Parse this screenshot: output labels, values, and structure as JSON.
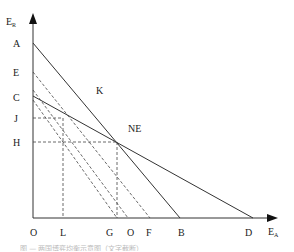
{
  "diagram": {
    "type": "economic-equilibrium-diagram",
    "axes": {
      "y_label": "E",
      "y_label_sub": "R",
      "x_label": "E",
      "x_label_sub": "A",
      "origin_label": "O"
    },
    "y_ticks": [
      "A",
      "E",
      "C",
      "J",
      "H"
    ],
    "x_ticks": [
      "O",
      "L",
      "G",
      "O",
      "F",
      "B",
      "D"
    ],
    "solid_lines": [
      {
        "name": "K",
        "from": "A",
        "to": "B"
      },
      {
        "name": "reaction-line",
        "from": "C",
        "to": "D"
      }
    ],
    "dashed_lines": [
      {
        "from": "E",
        "to": "F"
      },
      {
        "from": "C",
        "to": "O"
      },
      {
        "from": "C",
        "to": "G"
      }
    ],
    "point_labels": {
      "line_label": "K",
      "equilibrium": "NE"
    },
    "colors": {
      "line": "#333333",
      "dashed": "#444444",
      "background": "#ffffff"
    }
  },
  "caption": "图 — 两国博弈均衡示意图（文字截断）"
}
